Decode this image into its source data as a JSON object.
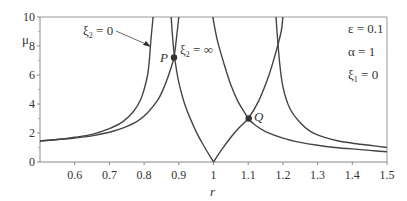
{
  "chart_data": {
    "type": "line",
    "title": "",
    "xlabel": "r",
    "ylabel": "μ",
    "xlim": [
      0.5,
      1.5
    ],
    "ylim": [
      0,
      10
    ],
    "xticks": [
      0.6,
      0.7,
      0.8,
      0.9,
      1,
      1.1,
      1.2,
      1.3,
      1.4,
      1.5
    ],
    "xtick_labels": [
      "0.6",
      "0.7",
      "0.8",
      "0.9",
      "1",
      "1.1",
      "1.2",
      "1.3",
      "1.4",
      "1.5"
    ],
    "yticks": [
      0,
      2,
      4,
      6,
      8,
      10
    ],
    "ytick_labels": [
      "0",
      "2",
      "4",
      "6",
      "8",
      "10"
    ],
    "grid": false,
    "parameters": [
      "ε = 0.1",
      "α = 1",
      "ξ₁ = 0"
    ],
    "series": [
      {
        "name": "ξ2 = 0 (left branch)",
        "x": [
          0.5,
          0.55,
          0.6,
          0.65,
          0.7,
          0.74,
          0.77,
          0.79,
          0.8,
          0.81,
          0.815,
          0.82,
          0.826
        ],
        "y": [
          1.45,
          1.55,
          1.7,
          1.9,
          2.3,
          2.8,
          3.5,
          4.3,
          5.0,
          6.0,
          7.0,
          8.5,
          10
        ]
      },
      {
        "name": "ξ2 = 0 (right branch)",
        "x": [
          1.18,
          1.19,
          1.2,
          1.22,
          1.25,
          1.28,
          1.32,
          1.36,
          1.4,
          1.45,
          1.5
        ],
        "y": [
          10,
          7.0,
          5.2,
          3.7,
          2.7,
          2.1,
          1.7,
          1.45,
          1.3,
          1.15,
          1.0
        ]
      },
      {
        "name": "ξ2 = ∞ (left branch)",
        "x": [
          0.5,
          0.55,
          0.6,
          0.65,
          0.7,
          0.74,
          0.78,
          0.81,
          0.84,
          0.86,
          0.875,
          0.886,
          0.893,
          0.9
        ],
        "y": [
          1.45,
          1.55,
          1.65,
          1.8,
          2.05,
          2.35,
          2.8,
          3.4,
          4.3,
          5.3,
          6.3,
          7.2,
          8.5,
          10
        ]
      },
      {
        "name": "ξ2 = ∞ (right branch)",
        "x": [
          0.998,
          1.01,
          1.03,
          1.05,
          1.07,
          1.09,
          1.1,
          1.12,
          1.15,
          1.2,
          1.25,
          1.3,
          1.35,
          1.4,
          1.45,
          1.5
        ],
        "y": [
          10,
          8.5,
          6.8,
          5.3,
          4.2,
          3.4,
          3.0,
          2.55,
          2.1,
          1.65,
          1.35,
          1.15,
          1.0,
          0.9,
          0.8,
          0.7
        ]
      },
      {
        "name": "boundary (left arm from cusp)",
        "x": [
          0.878,
          0.882,
          0.888,
          0.9,
          0.92,
          0.95,
          0.975,
          1.0
        ],
        "y": [
          10,
          8.6,
          7.2,
          5.5,
          3.8,
          2.1,
          1.0,
          0
        ]
      },
      {
        "name": "boundary (right arm from cusp)",
        "x": [
          1.0,
          1.025,
          1.05,
          1.075,
          1.1,
          1.13,
          1.16,
          1.18,
          1.195,
          1.2
        ],
        "y": [
          0,
          0.9,
          1.7,
          2.4,
          3.0,
          4.2,
          6.0,
          7.6,
          9.0,
          10
        ]
      }
    ],
    "annotations": [
      {
        "text": "ξ₂ = 0",
        "type": "label-with-arrow",
        "x": 0.615,
        "y": 9.0,
        "arrow_to": [
          0.805,
          7.9
        ]
      },
      {
        "text": "ξ₂ = ∞",
        "type": "label",
        "x": 0.905,
        "y": 7.5
      },
      {
        "text": "P",
        "type": "point",
        "x": 0.886,
        "y": 7.2
      },
      {
        "text": "Q",
        "type": "point",
        "x": 1.1,
        "y": 3.0
      }
    ]
  },
  "labels": {
    "y_axis": "μ",
    "x_axis": "r",
    "param_epsilon": "ε = 0.1",
    "param_alpha": "α = 1",
    "param_xi1_sym": "ξ",
    "param_xi1_sub": "1",
    "param_xi1_val": " = 0",
    "xi2_zero_sym": "ξ",
    "xi2_zero_sub": "2",
    "xi2_zero_val": " = 0",
    "xi2_inf_sym": "ξ",
    "xi2_inf_sub": "2",
    "xi2_inf_val": " = ∞",
    "point_p": "P",
    "point_q": "Q"
  },
  "colors": {
    "curve": "#444444",
    "axis": "#888888",
    "text": "#333333",
    "point": "#333333"
  }
}
